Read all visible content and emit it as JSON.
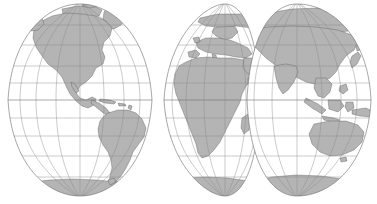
{
  "figure": {
    "kind": "world-map",
    "projection": "interrupted two-hemisphere globular projection",
    "background_color": "#ffffff",
    "land_color": "#b4b4b4",
    "land_outline_color": "#4a4a4a",
    "ocean_color": "#ffffff",
    "graticule_color": "#8a8a8a",
    "globe_outline_color": "#6b6b6b",
    "width_px": 377,
    "height_px": 204
  },
  "graticule": {
    "parallel_interval_degrees": 20,
    "meridian_interval_degrees": 30,
    "equator_latitude": 0,
    "latitude_range": [
      -90,
      90
    ],
    "longitude_range": [
      -180,
      180
    ],
    "parallels": [
      80,
      60,
      40,
      20,
      0,
      -20,
      -40,
      -60,
      -80
    ],
    "show_equator": true
  },
  "hemispheres": [
    {
      "name": "western-hemisphere",
      "label": "Western Hemisphere",
      "center_longitude": -90,
      "longitude_span": [
        -170,
        -10
      ],
      "landmasses": [
        "North America",
        "Central America",
        "Caribbean",
        "South America",
        "Greenland",
        "Antarctica"
      ]
    },
    {
      "name": "eastern-hemisphere-west-lobe",
      "label": "Europe and Africa",
      "center_longitude": 20,
      "longitude_span": [
        -25,
        60
      ],
      "landmasses": [
        "Europe",
        "Africa",
        "Madagascar",
        "Arabia",
        "Antarctica"
      ]
    },
    {
      "name": "eastern-hemisphere-east-lobe",
      "label": "Asia and Oceania",
      "center_longitude": 110,
      "longitude_span": [
        55,
        185
      ],
      "landmasses": [
        "Asia",
        "Siberia",
        "India",
        "Japan",
        "Indonesia",
        "Australia",
        "New Zealand",
        "Antarctica"
      ]
    }
  ],
  "continents": [
    {
      "name": "north-america",
      "label": "North America"
    },
    {
      "name": "south-america",
      "label": "South America"
    },
    {
      "name": "greenland",
      "label": "Greenland"
    },
    {
      "name": "europe",
      "label": "Europe"
    },
    {
      "name": "africa",
      "label": "Africa"
    },
    {
      "name": "madagascar",
      "label": "Madagascar"
    },
    {
      "name": "asia",
      "label": "Asia"
    },
    {
      "name": "india",
      "label": "India"
    },
    {
      "name": "japan",
      "label": "Japan"
    },
    {
      "name": "indonesia",
      "label": "Indonesia"
    },
    {
      "name": "australia",
      "label": "Australia"
    },
    {
      "name": "new-zealand",
      "label": "New Zealand"
    },
    {
      "name": "antarctica",
      "label": "Antarctica"
    }
  ]
}
